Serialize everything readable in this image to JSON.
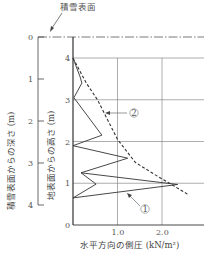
{
  "chart_data": {
    "type": "line",
    "title": "",
    "annotation_top": "積雪表面",
    "xlabel": "水平方向の側圧 (kN/m²)",
    "ylabel_left": "積雪表面からの深さ (m)",
    "ylabel_right": "地表面からの高さ (m)",
    "xlim": [
      0,
      2.8
    ],
    "ylim": [
      0,
      4
    ],
    "x_ticks": [
      "1.0",
      "2.0"
    ],
    "x_tick_values": [
      1.0,
      2.0
    ],
    "x_origin_label": "0",
    "y_ticks_height": [
      "0",
      "1",
      "2",
      "3",
      "4"
    ],
    "y_ticks_depth": [
      "0",
      "1",
      "2",
      "3",
      "4"
    ],
    "grid": true,
    "series": [
      {
        "name": "①",
        "style": "solid",
        "points": [
          {
            "pressure": 0.0,
            "height": 4.0
          },
          {
            "pressure": 0.16,
            "height": 3.55
          },
          {
            "pressure": 0.2,
            "height": 3.4
          },
          {
            "pressure": 0.02,
            "height": 3.05
          },
          {
            "pressure": 0.65,
            "height": 2.15
          },
          {
            "pressure": 0.0,
            "height": 1.9
          },
          {
            "pressure": 1.23,
            "height": 1.6
          },
          {
            "pressure": 0.18,
            "height": 1.25
          },
          {
            "pressure": 2.35,
            "height": 0.97
          },
          {
            "pressure": 0.0,
            "height": 0.65
          },
          {
            "pressure": 0.52,
            "height": 0.98
          },
          {
            "pressure": 0.18,
            "height": 1.25
          }
        ]
      },
      {
        "name": "②",
        "style": "dashed",
        "points": [
          {
            "pressure": 0.0,
            "height": 4.0
          },
          {
            "pressure": 0.3,
            "height": 3.4
          },
          {
            "pressure": 0.55,
            "height": 3.0
          },
          {
            "pressure": 1.0,
            "height": 2.05
          },
          {
            "pressure": 1.4,
            "height": 1.5
          },
          {
            "pressure": 1.85,
            "height": 1.2
          },
          {
            "pressure": 2.2,
            "height": 0.98
          },
          {
            "pressure": 2.6,
            "height": 0.72
          }
        ]
      }
    ],
    "legend": [
      "①",
      "②"
    ]
  }
}
